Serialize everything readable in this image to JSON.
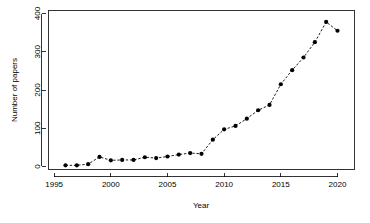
{
  "chart_data": {
    "type": "line",
    "title": "",
    "subtitle": "",
    "xlabel": "Year",
    "ylabel": "Number of papers",
    "x": [
      1996,
      1997,
      1998,
      1999,
      2000,
      2001,
      2002,
      2003,
      2004,
      2005,
      2006,
      2007,
      2008,
      2009,
      2010,
      2011,
      2012,
      2013,
      2014,
      2015,
      2016,
      2017,
      2018,
      2019,
      2020
    ],
    "values": [
      3,
      3,
      6,
      25,
      16,
      17,
      17,
      24,
      22,
      26,
      31,
      35,
      33,
      70,
      97,
      106,
      125,
      147,
      161,
      215,
      252,
      285,
      325,
      378,
      355
    ],
    "xlim": [
      1994.5,
      2021.5
    ],
    "ylim": [
      -8,
      408
    ],
    "xticks": [
      1995,
      2000,
      2005,
      2010,
      2015,
      2020
    ],
    "xtick_labels": [
      "1995",
      "2000",
      "2005",
      "2010",
      "2015",
      "2020"
    ],
    "yticks": [
      0,
      100,
      200,
      300,
      400
    ],
    "ytick_labels": [
      "0",
      "100",
      "200",
      "300",
      "400"
    ],
    "grid": false,
    "legend": null,
    "line_style": "dashed",
    "marker": "filled-circle",
    "series_color": "#000000",
    "background_color": "#ffffff",
    "annotations": []
  }
}
